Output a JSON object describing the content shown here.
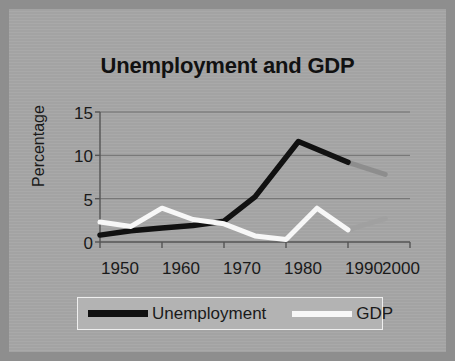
{
  "chart_data": {
    "type": "line",
    "title": "Unemployment and GDP",
    "xlabel": "",
    "ylabel": "Percentage",
    "xlim": [
      1950,
      2000
    ],
    "ylim": [
      0,
      15
    ],
    "yticks": [
      0,
      5,
      10,
      15
    ],
    "xticks": [
      1950,
      1960,
      1970,
      1980,
      1990,
      2000
    ],
    "grid": true,
    "legend_position": "bottom",
    "series": [
      {
        "name": "Unemployment",
        "color": "#111111",
        "faded_color": "#8a8a8a",
        "x": [
          1950,
          1955,
          1960,
          1965,
          1970,
          1975,
          1982,
          1990,
          1996
        ],
        "values": [
          0.8,
          1.3,
          1.6,
          1.9,
          2.4,
          5.2,
          11.6,
          9.2,
          7.8
        ],
        "faded_from": 1990
      },
      {
        "name": "GDP",
        "color": "#f7f7f7",
        "faded_color": "#a0a0a0",
        "x": [
          1950,
          1955,
          1960,
          1965,
          1970,
          1975,
          1980,
          1985,
          1990,
          1996
        ],
        "values": [
          2.3,
          1.8,
          3.9,
          2.6,
          2.1,
          0.7,
          0.3,
          3.9,
          1.4,
          2.7
        ],
        "faded_from": 1990
      }
    ]
  },
  "axis": {
    "y_tick_labels": [
      "15",
      "10",
      "5",
      "0"
    ],
    "x_tick_labels": [
      "1950",
      "1960",
      "1970",
      "1980",
      "1990",
      "2000"
    ],
    "y_title": "Percentage"
  },
  "legend": {
    "entries": [
      {
        "label": "Unemployment",
        "swatch": "black-line-swatch"
      },
      {
        "label": "GDP",
        "swatch": "white-line-swatch"
      }
    ]
  }
}
